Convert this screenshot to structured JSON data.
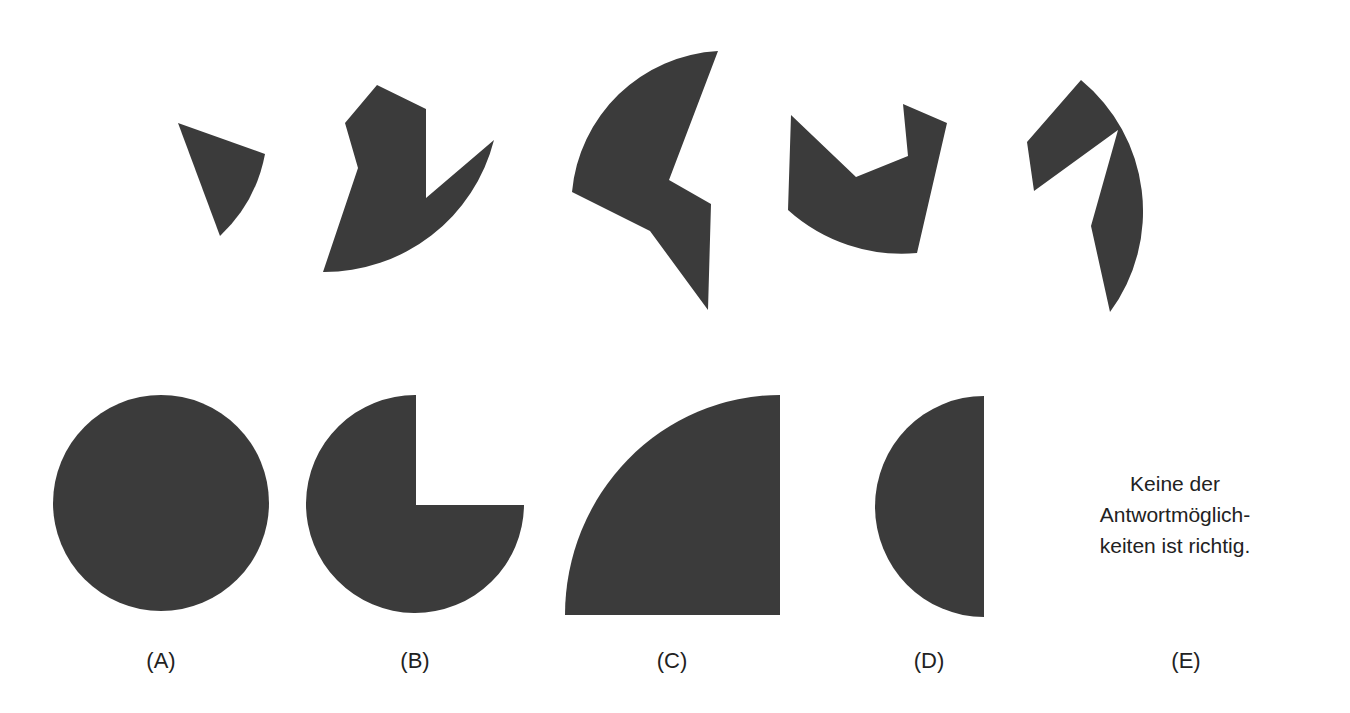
{
  "puzzle": {
    "type": "shape-assembly",
    "fill_color": "#3b3b3b",
    "background": "#ffffff",
    "pieces_count": 5
  },
  "options": [
    {
      "id": "A",
      "label": "(A)",
      "shape": "full-circle"
    },
    {
      "id": "B",
      "label": "(B)",
      "shape": "three-quarter-circle"
    },
    {
      "id": "C",
      "label": "(C)",
      "shape": "quarter-circle"
    },
    {
      "id": "D",
      "label": "(D)",
      "shape": "half-circle"
    },
    {
      "id": "E",
      "label": "(E)",
      "shape": "none",
      "text_lines": [
        "Keine der",
        "Antwortmöglich-",
        "keiten ist richtig."
      ]
    }
  ]
}
